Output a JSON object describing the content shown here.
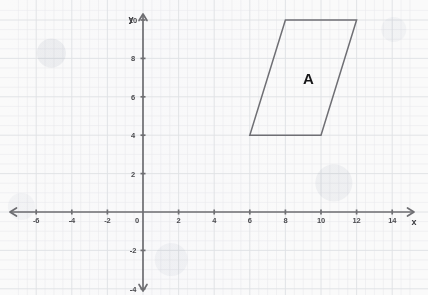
{
  "chart_data": {
    "type": "scatter",
    "title": "",
    "xlabel": "x",
    "ylabel": "y",
    "xlim": [
      -7,
      15
    ],
    "ylim": [
      -5,
      10.5
    ],
    "grid": true,
    "grid_minor_step": 0.5,
    "grid_major_step": 2,
    "legend": "none",
    "x_ticks": [
      {
        "value": -6,
        "label": "-6"
      },
      {
        "value": -4,
        "label": "-4"
      },
      {
        "value": -2,
        "label": "-2"
      },
      {
        "value": 0,
        "label": "0"
      },
      {
        "value": 2,
        "label": "2"
      },
      {
        "value": 4,
        "label": "4"
      },
      {
        "value": 6,
        "label": "6"
      },
      {
        "value": 8,
        "label": "8"
      },
      {
        "value": 10,
        "label": "10"
      },
      {
        "value": 12,
        "label": "12"
      },
      {
        "value": 14,
        "label": "14"
      }
    ],
    "y_ticks": [
      {
        "value": 10,
        "label": "10"
      },
      {
        "value": 8,
        "label": "8"
      },
      {
        "value": 6,
        "label": "6"
      },
      {
        "value": 4,
        "label": "4"
      },
      {
        "value": 2,
        "label": "2"
      },
      {
        "value": -2,
        "label": "-2"
      },
      {
        "value": -4,
        "label": "-4"
      }
    ],
    "shapes": [
      {
        "name": "A",
        "type": "parallelogram",
        "label": "A",
        "label_position": {
          "x": 9.3,
          "y": 7.0
        },
        "stroke": "#6f6f74",
        "fill": "none",
        "vertices": [
          {
            "x": 8,
            "y": 10
          },
          {
            "x": 12,
            "y": 10
          },
          {
            "x": 10,
            "y": 4
          },
          {
            "x": 6,
            "y": 4
          }
        ]
      }
    ]
  },
  "axes": {
    "x_axis_name": "x",
    "y_axis_name": "y",
    "origin_label": "0",
    "arrowheads": "both-ends"
  },
  "colors": {
    "background": "#fafafa",
    "grid_minor": "#e9eaec",
    "grid_major": "#dfe1e4",
    "axis": "#6e6e72",
    "shape_stroke": "#6f6f74",
    "tick_text": "#4a4a4e",
    "shape_label_text": "#161618"
  }
}
